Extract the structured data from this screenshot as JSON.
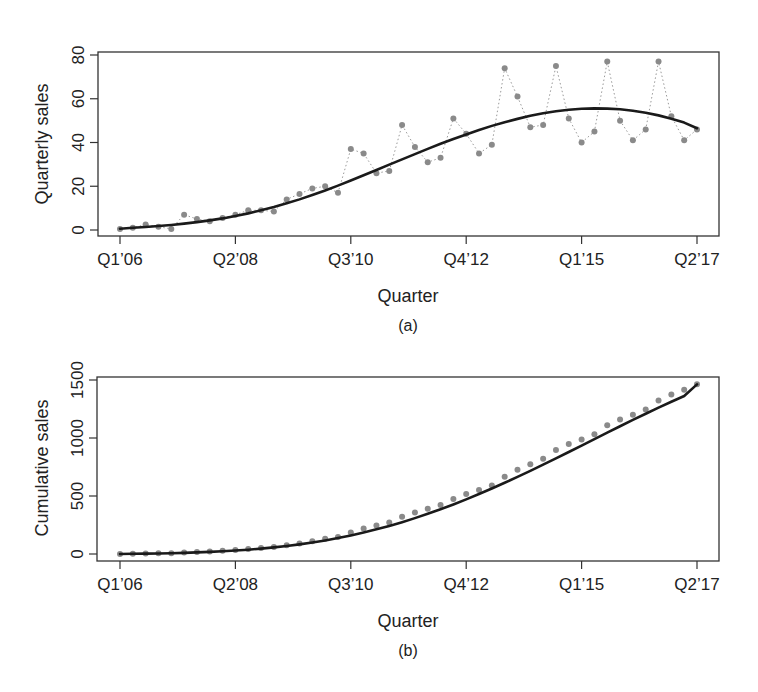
{
  "chart_data": [
    {
      "id": "a",
      "type": "scatter",
      "caption": "(a)",
      "title": "",
      "xlabel": "Quarter",
      "ylabel": "Quarterly sales",
      "ylim": [
        0,
        80
      ],
      "yticks": [
        0,
        20,
        40,
        60,
        80
      ],
      "xticks": [
        {
          "index": 0,
          "label": "Q1’06"
        },
        {
          "index": 9,
          "label": "Q2’08"
        },
        {
          "index": 18,
          "label": "Q3’10"
        },
        {
          "index": 27,
          "label": "Q4’12"
        },
        {
          "index": 36,
          "label": "Q1’15"
        },
        {
          "index": 45,
          "label": "Q2’17"
        }
      ],
      "grid": false,
      "legend": null,
      "series": [
        {
          "name": "Observed quarterly sales",
          "style": "points joined by dotted line",
          "color": "#8a8a8a",
          "values": [
            0.5,
            1,
            2.5,
            1.5,
            0.5,
            7,
            5,
            4,
            5.5,
            7,
            9,
            9,
            8.5,
            14,
            16.5,
            19,
            20,
            17,
            37,
            35,
            26,
            27,
            48,
            38,
            31,
            33,
            51,
            44,
            35,
            39,
            74,
            61,
            47,
            48,
            75,
            51,
            40,
            45,
            77,
            50,
            41,
            46,
            77,
            52,
            41,
            46
          ]
        },
        {
          "name": "Fitted diffusion curve",
          "style": "solid line",
          "color": "#1a1a1a",
          "values": [
            0.6,
            1.0,
            1.4,
            1.8,
            2.3,
            2.9,
            3.6,
            4.4,
            5.3,
            6.4,
            7.6,
            9.0,
            10.5,
            12.2,
            14.0,
            16.0,
            18.1,
            20.3,
            22.6,
            25.0,
            27.4,
            29.9,
            32.3,
            34.7,
            37.1,
            39.4,
            41.6,
            43.7,
            45.7,
            47.6,
            49.3,
            50.8,
            52.2,
            53.4,
            54.3,
            55.0,
            55.4,
            55.6,
            55.5,
            55.2,
            54.5,
            53.6,
            52.4,
            50.9,
            49.1,
            46.5
          ]
        }
      ]
    },
    {
      "id": "b",
      "type": "line",
      "caption": "(b)",
      "title": "",
      "xlabel": "Quarter",
      "ylabel": "Cumulative sales",
      "ylim": [
        0,
        1500
      ],
      "yticks": [
        0,
        500,
        1000,
        1500
      ],
      "xticks": [
        {
          "index": 0,
          "label": "Q1’06"
        },
        {
          "index": 9,
          "label": "Q2’08"
        },
        {
          "index": 18,
          "label": "Q3’10"
        },
        {
          "index": 27,
          "label": "Q4’12"
        },
        {
          "index": 36,
          "label": "Q1’15"
        },
        {
          "index": 45,
          "label": "Q2’17"
        }
      ],
      "grid": false,
      "legend": null,
      "series": [
        {
          "name": "Observed cumulative sales",
          "style": "points",
          "color": "#8a8a8a",
          "values": [
            0.5,
            1.5,
            4,
            5.5,
            6,
            13,
            18,
            22,
            27.5,
            34.5,
            43.5,
            52.5,
            61,
            75,
            91.5,
            110.5,
            130.5,
            147.5,
            184.5,
            219.5,
            245.5,
            272.5,
            320.5,
            358.5,
            389.5,
            422.5,
            473.5,
            517.5,
            552.5,
            591.5,
            665.5,
            726.5,
            773.5,
            821.5,
            896.5,
            947.5,
            987.5,
            1032.5,
            1109.5,
            1159.5,
            1200.5,
            1246.5,
            1323.5,
            1375.5,
            1416.5,
            1462.5
          ]
        },
        {
          "name": "Fitted cumulative curve",
          "style": "solid line",
          "color": "#1a1a1a",
          "values": [
            0.6,
            1.6,
            3.0,
            4.8,
            7.1,
            10.0,
            13.6,
            18.0,
            23.3,
            29.7,
            37.3,
            46.3,
            56.8,
            69.0,
            83.0,
            99.0,
            117.1,
            137.4,
            160.0,
            185.0,
            212.4,
            242.3,
            274.6,
            309.3,
            346.4,
            385.8,
            427.4,
            471.1,
            516.8,
            564.4,
            613.7,
            664.5,
            716.7,
            770.1,
            824.4,
            879.4,
            934.8,
            990.4,
            1045.9,
            1101.1,
            1155.6,
            1209.2,
            1261.6,
            1312.5,
            1361.6,
            1462.0
          ]
        }
      ]
    }
  ]
}
